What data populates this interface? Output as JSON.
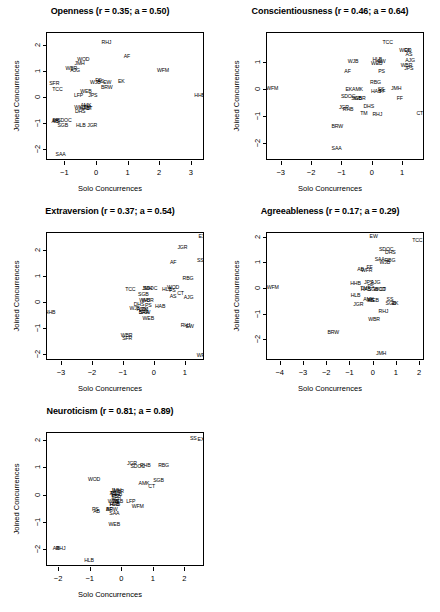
{
  "figure": {
    "width": 440,
    "height": 612,
    "background": "#ffffff",
    "axis_color": "#000000",
    "text_color": "#000000"
  },
  "common": {
    "xlabel": "Solo Concurrences",
    "ylabel": "Joined Concurrences"
  },
  "chart_data": [
    {
      "type": "scatter",
      "title": "Openness (r = 0.35; a = 0.50)",
      "trait": "Openness",
      "r": 0.35,
      "a": 0.5,
      "xlabel": "Solo Concurrences",
      "ylabel": "Joined Concurrences",
      "xlim": [
        -1.55,
        3.45
      ],
      "ylim": [
        -2.45,
        2.45
      ],
      "xticks": [
        -1,
        0,
        1,
        2,
        3
      ],
      "yticks": [
        -2,
        -1,
        0,
        1,
        2
      ],
      "grid": false,
      "legend": "none",
      "marker": "text-label",
      "points": [
        {
          "label": "RHJ",
          "x": 0.33,
          "y": 2.07
        },
        {
          "label": "AF",
          "x": 0.98,
          "y": 1.52
        },
        {
          "label": "WOD",
          "x": -0.4,
          "y": 1.43
        },
        {
          "label": "JMH",
          "x": -0.52,
          "y": 1.28
        },
        {
          "label": "WBR",
          "x": -0.78,
          "y": 1.08
        },
        {
          "label": "AJG",
          "x": -0.66,
          "y": 0.98
        },
        {
          "label": "WFM",
          "x": 2.12,
          "y": 1.0
        },
        {
          "label": "FS",
          "x": 0.08,
          "y": 0.62
        },
        {
          "label": "AS",
          "x": 0.14,
          "y": 0.58
        },
        {
          "label": "WJB",
          "x": -0.02,
          "y": 0.55
        },
        {
          "label": "EW",
          "x": 0.36,
          "y": 0.53
        },
        {
          "label": "EK",
          "x": 0.8,
          "y": 0.57
        },
        {
          "label": "SFR",
          "x": -1.32,
          "y": 0.5
        },
        {
          "label": "BRW",
          "x": 0.34,
          "y": 0.33
        },
        {
          "label": "TCC",
          "x": -1.22,
          "y": 0.28
        },
        {
          "label": "WEB",
          "x": -0.32,
          "y": 0.2
        },
        {
          "label": "LFP",
          "x": -0.55,
          "y": 0.02
        },
        {
          "label": "JPS",
          "x": -0.1,
          "y": 0.02
        },
        {
          "label": "HHB",
          "x": 3.28,
          "y": 0.04
        },
        {
          "label": "AMK",
          "x": -0.32,
          "y": -0.35
        },
        {
          "label": "WHJ",
          "x": -0.52,
          "y": -0.44
        },
        {
          "label": "HAB",
          "x": -0.36,
          "y": -0.45
        },
        {
          "label": "TM",
          "x": -0.28,
          "y": -0.44
        },
        {
          "label": "CT",
          "x": -0.22,
          "y": -0.45
        },
        {
          "label": "DHS",
          "x": -0.5,
          "y": -0.58
        },
        {
          "label": "FF",
          "x": -1.28,
          "y": -0.93
        },
        {
          "label": "AB",
          "x": -1.3,
          "y": -0.95
        },
        {
          "label": "PS",
          "x": -1.25,
          "y": -0.97
        },
        {
          "label": "SDOC",
          "x": -1.0,
          "y": -0.9
        },
        {
          "label": "SGB",
          "x": -1.05,
          "y": -1.1
        },
        {
          "label": "HLB",
          "x": -0.48,
          "y": -1.12
        },
        {
          "label": "JGR",
          "x": -0.12,
          "y": -1.12
        },
        {
          "label": "SAA",
          "x": -1.12,
          "y": -2.22
        }
      ]
    },
    {
      "type": "scatter",
      "title": "Conscientiousness (r = 0.46; a = 0.64)",
      "trait": "Conscientiousness",
      "r": 0.46,
      "a": 0.64,
      "xlabel": "Solo Concurrences",
      "ylabel": "Joined Concurrences",
      "xlim": [
        -3.45,
        1.75
      ],
      "ylim": [
        -2.65,
        2.05
      ],
      "xticks": [
        -3,
        -2,
        -1,
        0,
        1
      ],
      "yticks": [
        -2,
        -1,
        0,
        1
      ],
      "grid": false,
      "legend": "none",
      "marker": "text-label",
      "points": [
        {
          "label": "TCC",
          "x": 0.52,
          "y": 1.7
        },
        {
          "label": "WOD",
          "x": 1.1,
          "y": 1.4
        },
        {
          "label": "EK",
          "x": 1.18,
          "y": 1.38
        },
        {
          "label": "AS",
          "x": 1.22,
          "y": 1.24
        },
        {
          "label": "HLB",
          "x": 0.18,
          "y": 1.06
        },
        {
          "label": "EW",
          "x": 0.32,
          "y": 0.98
        },
        {
          "label": "WJB",
          "x": -0.62,
          "y": 1.0
        },
        {
          "label": "WEB",
          "x": 0.16,
          "y": 0.92
        },
        {
          "label": "AJG",
          "x": 1.26,
          "y": 1.02
        },
        {
          "label": "WBR",
          "x": 1.14,
          "y": 0.82
        },
        {
          "label": "JPS",
          "x": 1.22,
          "y": 0.74
        },
        {
          "label": "AF",
          "x": -0.8,
          "y": 0.62
        },
        {
          "label": "PS",
          "x": 0.32,
          "y": 0.62
        },
        {
          "label": "RBG",
          "x": 0.12,
          "y": 0.2
        },
        {
          "label": "EKAMK",
          "x": -0.58,
          "y": -0.06
        },
        {
          "label": "HAB",
          "x": 0.14,
          "y": -0.1
        },
        {
          "label": "SS",
          "x": 0.3,
          "y": -0.06
        },
        {
          "label": "FF",
          "x": 0.34,
          "y": -0.12
        },
        {
          "label": "JMH",
          "x": 0.8,
          "y": 0.0
        },
        {
          "label": "WFM",
          "x": -3.28,
          "y": 0.0
        },
        {
          "label": "SDOC",
          "x": -0.78,
          "y": -0.3
        },
        {
          "label": "SGB",
          "x": -0.5,
          "y": -0.38
        },
        {
          "label": "WBR",
          "x": -0.4,
          "y": -0.38
        },
        {
          "label": "FF",
          "x": 0.92,
          "y": -0.36
        },
        {
          "label": "JGR",
          "x": -0.92,
          "y": -0.7
        },
        {
          "label": "RHB",
          "x": -0.78,
          "y": -0.78
        },
        {
          "label": "DHS",
          "x": -0.1,
          "y": -0.68
        },
        {
          "label": "TM",
          "x": -0.26,
          "y": -0.94
        },
        {
          "label": "RHJ",
          "x": 0.18,
          "y": -0.96
        },
        {
          "label": "CT",
          "x": 1.58,
          "y": -0.92
        },
        {
          "label": "BRW",
          "x": -1.14,
          "y": -1.4
        },
        {
          "label": "SAA",
          "x": -1.16,
          "y": -2.22
        }
      ]
    },
    {
      "type": "scatter",
      "title": "Extraversion (r = 0.37; a = 0.54)",
      "trait": "Extraversion",
      "r": 0.37,
      "a": 0.54,
      "xlabel": "Solo Concurrences",
      "ylabel": "Joined Concurrences",
      "xlim": [
        -3.45,
        1.65
      ],
      "ylim": [
        -2.25,
        2.65
      ],
      "xticks": [
        -3,
        -2,
        -1,
        0,
        1
      ],
      "yticks": [
        -2,
        -1,
        0,
        1,
        2
      ],
      "grid": false,
      "legend": "none",
      "marker": "text-label",
      "points": [
        {
          "label": "EX",
          "x": 1.55,
          "y": 2.48
        },
        {
          "label": "JGR",
          "x": 0.92,
          "y": 2.08
        },
        {
          "label": "SS",
          "x": 1.5,
          "y": 1.58
        },
        {
          "label": "AF",
          "x": 0.62,
          "y": 1.52
        },
        {
          "label": "RBG",
          "x": 1.1,
          "y": 0.9
        },
        {
          "label": "TCC",
          "x": -0.76,
          "y": 0.48
        },
        {
          "label": "JMH",
          "x": -0.22,
          "y": 0.5
        },
        {
          "label": "SDOC",
          "x": -0.12,
          "y": 0.5
        },
        {
          "label": "HLB",
          "x": 0.42,
          "y": 0.48
        },
        {
          "label": "WOD",
          "x": 0.62,
          "y": 0.54
        },
        {
          "label": "FS",
          "x": 0.6,
          "y": 0.42
        },
        {
          "label": "CT",
          "x": 0.86,
          "y": 0.32
        },
        {
          "label": "SGB",
          "x": -0.34,
          "y": 0.26
        },
        {
          "label": "AS",
          "x": 0.62,
          "y": 0.2
        },
        {
          "label": "AJG",
          "x": 1.12,
          "y": 0.18
        },
        {
          "label": "WHJ",
          "x": -0.3,
          "y": 0.06
        },
        {
          "label": "WBR",
          "x": -0.2,
          "y": 0.06
        },
        {
          "label": "DHS",
          "x": -0.48,
          "y": -0.12
        },
        {
          "label": "PS",
          "x": -0.18,
          "y": -0.16
        },
        {
          "label": "HAB",
          "x": 0.2,
          "y": -0.18
        },
        {
          "label": "WJB",
          "x": -0.62,
          "y": -0.26
        },
        {
          "label": "AMK",
          "x": -0.38,
          "y": -0.28
        },
        {
          "label": "TM",
          "x": -0.3,
          "y": -0.3
        },
        {
          "label": "SAA",
          "x": -0.32,
          "y": -0.4
        },
        {
          "label": "BRW",
          "x": -0.3,
          "y": -0.42
        },
        {
          "label": "HHB",
          "x": -3.35,
          "y": -0.42
        },
        {
          "label": "WEB",
          "x": -0.18,
          "y": -0.66
        },
        {
          "label": "RHJ",
          "x": 1.02,
          "y": -0.92
        },
        {
          "label": "EW",
          "x": 1.16,
          "y": -0.94
        },
        {
          "label": "WBR",
          "x": -0.88,
          "y": -1.3
        },
        {
          "label": "SFR",
          "x": -0.86,
          "y": -1.42
        },
        {
          "label": "WFM",
          "x": 1.58,
          "y": -2.04
        }
      ]
    },
    {
      "type": "scatter",
      "title": "Agreeableness (r = 0.17; a = 0.29)",
      "trait": "Agreeableness",
      "r": 0.17,
      "a": 0.29,
      "xlabel": "Solo Concurrences",
      "ylabel": "Joined Concurrences",
      "xlim": [
        -4.55,
        2.25
      ],
      "ylim": [
        -2.85,
        2.15
      ],
      "xticks": [
        -4,
        -3,
        -2,
        -1,
        0,
        1,
        2
      ],
      "yticks": [
        -2,
        -1,
        0,
        1,
        2
      ],
      "grid": false,
      "legend": "none",
      "marker": "text-label",
      "points": [
        {
          "label": "EW",
          "x": 0.04,
          "y": 1.98
        },
        {
          "label": "TCC",
          "x": 1.92,
          "y": 1.82
        },
        {
          "label": "SDOC",
          "x": 0.58,
          "y": 1.48
        },
        {
          "label": "DHS",
          "x": 0.76,
          "y": 1.36
        },
        {
          "label": "SAA",
          "x": 0.3,
          "y": 1.1
        },
        {
          "label": "RBG",
          "x": 0.74,
          "y": 1.06
        },
        {
          "label": "WJB",
          "x": 0.52,
          "y": 0.96
        },
        {
          "label": "FF",
          "x": -0.14,
          "y": 0.8
        },
        {
          "label": "AB",
          "x": -0.52,
          "y": 0.7
        },
        {
          "label": "WFR",
          "x": -0.26,
          "y": 0.68
        },
        {
          "label": "JPS",
          "x": -0.18,
          "y": 0.2
        },
        {
          "label": "AJG",
          "x": 0.12,
          "y": 0.18
        },
        {
          "label": "HHB",
          "x": -0.74,
          "y": 0.16
        },
        {
          "label": "PS",
          "x": -0.08,
          "y": 0.04
        },
        {
          "label": "WFM",
          "x": -4.3,
          "y": 0.0
        },
        {
          "label": "TM",
          "x": -0.38,
          "y": -0.04
        },
        {
          "label": "HAB",
          "x": -0.3,
          "y": -0.06
        },
        {
          "label": "SGB",
          "x": 0.02,
          "y": -0.06
        },
        {
          "label": "WOD",
          "x": 0.3,
          "y": -0.08
        },
        {
          "label": "CT",
          "x": 0.42,
          "y": -0.08
        },
        {
          "label": "HLB",
          "x": -0.74,
          "y": -0.3
        },
        {
          "label": "AMK",
          "x": -0.18,
          "y": -0.48
        },
        {
          "label": "WEB",
          "x": 0.02,
          "y": -0.5
        },
        {
          "label": "AS",
          "x": -0.1,
          "y": -0.5
        },
        {
          "label": "SS",
          "x": 0.74,
          "y": -0.46
        },
        {
          "label": "SGB",
          "x": 0.78,
          "y": -0.62
        },
        {
          "label": "EK",
          "x": 0.96,
          "y": -0.64
        },
        {
          "label": "JGR",
          "x": -0.62,
          "y": -0.68
        },
        {
          "label": "RHJ",
          "x": 0.46,
          "y": -0.92
        },
        {
          "label": "WBR",
          "x": 0.06,
          "y": -1.24
        },
        {
          "label": "BRW",
          "x": -1.7,
          "y": -1.76
        },
        {
          "label": "JMH",
          "x": 0.36,
          "y": -2.56
        }
      ]
    },
    {
      "type": "scatter",
      "title": "Neuroticism (r = 0.81; a = 0.89)",
      "trait": "Neuroticism",
      "r": 0.81,
      "a": 0.89,
      "xlabel": "Solo Concurrences",
      "ylabel": "Joined Concurrences",
      "xlim": [
        -2.35,
        2.65
      ],
      "ylim": [
        -2.65,
        2.25
      ],
      "xticks": [
        -2,
        -1,
        0,
        1,
        2
      ],
      "yticks": [
        -2,
        -1,
        0,
        1,
        2
      ],
      "grid": false,
      "legend": "none",
      "marker": "text-label",
      "points": [
        {
          "label": "SS",
          "x": 2.28,
          "y": 2.04
        },
        {
          "label": "EX",
          "x": 2.52,
          "y": 2.0
        },
        {
          "label": "JGR",
          "x": 0.34,
          "y": 1.1
        },
        {
          "label": "SDOC",
          "x": 0.52,
          "y": 1.02
        },
        {
          "label": "RHB",
          "x": 0.76,
          "y": 1.04
        },
        {
          "label": "RBG",
          "x": 1.34,
          "y": 1.04
        },
        {
          "label": "WOD",
          "x": -0.86,
          "y": 0.52
        },
        {
          "label": "SGB",
          "x": 1.18,
          "y": 0.5
        },
        {
          "label": "AMK",
          "x": 0.72,
          "y": 0.38
        },
        {
          "label": "CT",
          "x": 0.96,
          "y": 0.28
        },
        {
          "label": "JMH",
          "x": -0.16,
          "y": 0.14
        },
        {
          "label": "WBR",
          "x": -0.1,
          "y": 0.1
        },
        {
          "label": "AS",
          "x": -0.26,
          "y": 0.02
        },
        {
          "label": "TCC",
          "x": -0.2,
          "y": 0.02
        },
        {
          "label": "HHB",
          "x": -0.14,
          "y": 0.0
        },
        {
          "label": "FS",
          "x": -0.2,
          "y": -0.1
        },
        {
          "label": "SFR",
          "x": -0.16,
          "y": -0.12
        },
        {
          "label": "WJB",
          "x": -0.26,
          "y": -0.26
        },
        {
          "label": "TM",
          "x": -0.18,
          "y": -0.26
        },
        {
          "label": "WEB",
          "x": -0.12,
          "y": -0.26
        },
        {
          "label": "LFP",
          "x": 0.3,
          "y": -0.26
        },
        {
          "label": "HLB",
          "x": -0.22,
          "y": -0.38
        },
        {
          "label": "HAB",
          "x": -0.2,
          "y": -0.4
        },
        {
          "label": "WFM",
          "x": 0.52,
          "y": -0.44
        },
        {
          "label": "PS",
          "x": -0.82,
          "y": -0.56
        },
        {
          "label": "AB",
          "x": -0.78,
          "y": -0.64
        },
        {
          "label": "AF",
          "x": -0.38,
          "y": -0.58
        },
        {
          "label": "BRW",
          "x": -0.3,
          "y": -0.58
        },
        {
          "label": "SAA",
          "x": -0.22,
          "y": -0.7
        },
        {
          "label": "WEB",
          "x": -0.22,
          "y": -1.12
        },
        {
          "label": "AB",
          "x": -2.06,
          "y": -1.98
        },
        {
          "label": "RHJ",
          "x": -1.92,
          "y": -2.0
        },
        {
          "label": "HLB",
          "x": -1.02,
          "y": -2.44
        }
      ]
    }
  ]
}
